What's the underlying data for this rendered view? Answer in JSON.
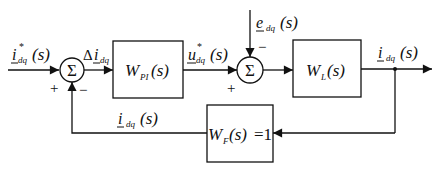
{
  "diagram": {
    "type": "control-loop-block-diagram",
    "signals": {
      "reference": {
        "main": "i",
        "sup": "*",
        "sub": "dq",
        "arg": "(s)"
      },
      "error": {
        "prefix": "Δ",
        "main": "i",
        "sub": "dq"
      },
      "controller_output": {
        "main": "u",
        "sup": "*",
        "sub": "dq",
        "arg": "(s)"
      },
      "disturbance": {
        "main": "e",
        "sub": "dq",
        "arg": "(s)"
      },
      "output": {
        "main": "i",
        "sub": "dq",
        "arg": "(s)"
      },
      "feedback": {
        "main": "i",
        "sub": "dq",
        "arg": "(s)"
      }
    },
    "summing_junctions": [
      {
        "id": "sum1",
        "symbol": "Σ",
        "plus": "+",
        "minus": "−"
      },
      {
        "id": "sum2",
        "symbol": "Σ",
        "plus": "+",
        "minus": "−"
      }
    ],
    "blocks": [
      {
        "id": "pi",
        "main": "W",
        "sub": "PI",
        "arg": "(s)"
      },
      {
        "id": "plant",
        "main": "W",
        "sub": "L",
        "arg": "(s)"
      },
      {
        "id": "feedback",
        "main": "W",
        "sub": "F",
        "arg": "(s)",
        "suffix": "=1"
      }
    ]
  }
}
